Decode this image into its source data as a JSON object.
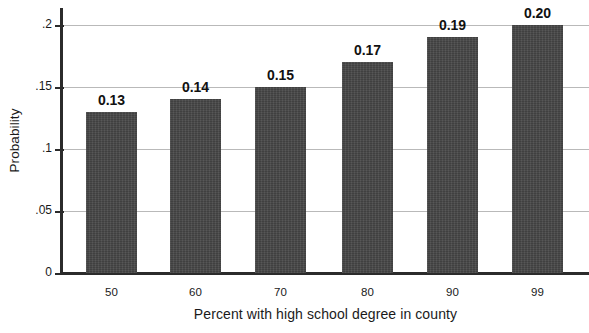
{
  "chart_data": {
    "type": "bar",
    "title": "",
    "subtitle": "",
    "xlabel": "Percent with high school degree in county",
    "ylabel": "Probability",
    "categories": [
      "50",
      "60",
      "70",
      "80",
      "90",
      "99"
    ],
    "values": [
      0.13,
      0.14,
      0.15,
      0.17,
      0.19,
      0.2
    ],
    "value_labels": [
      "0.13",
      "0.14",
      "0.15",
      "0.17",
      "0.19",
      "0.20"
    ],
    "ylim": [
      0,
      0.2
    ],
    "xlim_note": "categorical",
    "y_ticks": [
      0,
      0.05,
      0.1,
      0.15,
      0.2
    ],
    "y_tick_labels": [
      "0",
      ".05",
      ".1",
      ".15",
      ".2"
    ],
    "grid": "horizontal",
    "legend": "none",
    "bar_color": "#474747",
    "gridline_color": "#b9b9b9",
    "axis_color": "#2b2b2b",
    "background_color": "#ffffff",
    "annotations": []
  },
  "axes": {
    "y_title": "Probability",
    "x_title": "Percent with high school degree in county",
    "y_tick_labels": [
      "0",
      ".05",
      ".1",
      ".15",
      ".2"
    ],
    "x_tick_labels": [
      "50",
      "60",
      "70",
      "80",
      "90",
      "99"
    ]
  },
  "bars": [
    {
      "category": "50",
      "value": 0.13,
      "label": "0.13"
    },
    {
      "category": "60",
      "value": 0.14,
      "label": "0.14"
    },
    {
      "category": "70",
      "value": 0.15,
      "label": "0.15"
    },
    {
      "category": "80",
      "value": 0.17,
      "label": "0.17"
    },
    {
      "category": "90",
      "value": 0.19,
      "label": "0.19"
    },
    {
      "category": "99",
      "value": 0.2,
      "label": "0.20"
    }
  ]
}
